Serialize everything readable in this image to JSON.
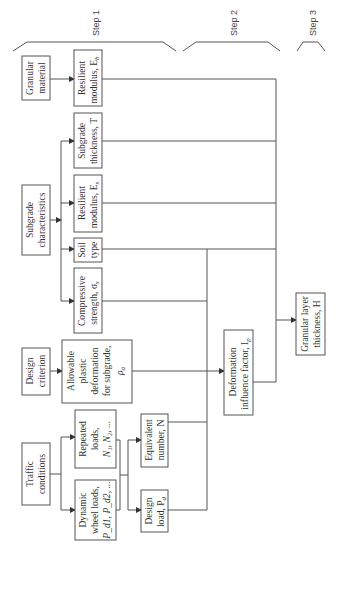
{
  "steps": [
    {
      "label": "Step 1"
    },
    {
      "label": "Step 2"
    },
    {
      "label": "Step 3"
    }
  ],
  "boxes": {
    "granular_material": {
      "lines": [
        "Granular",
        "material"
      ]
    },
    "resilient_modulus_base": {
      "lines": [
        "Resilient",
        "modulus, E"
      ],
      "sub": "b"
    },
    "subgrade_characteristics": {
      "lines": [
        "Subgrade",
        "characteristics"
      ]
    },
    "subgrade_thickness": {
      "lines": [
        "Subgrade",
        "thickness, T"
      ]
    },
    "resilient_modulus_subgrade": {
      "lines": [
        "Resilient",
        "modulus, E"
      ],
      "sub": "s"
    },
    "soil_type": {
      "lines": [
        "Soil",
        "type"
      ]
    },
    "compressive_strength": {
      "lines": [
        "Compressive",
        "strength, σ"
      ],
      "sub": "s"
    },
    "design_criterion": {
      "lines": [
        "Design",
        "criterion"
      ]
    },
    "allowable_plastic_deformation": {
      "lines": [
        "Allowable",
        "plastic",
        "deformation",
        "for subgrade,",
        "ρ"
      ],
      "sub": "a"
    },
    "traffic_conditions": {
      "lines": [
        "Traffic",
        "conditions"
      ]
    },
    "repeated_loads": {
      "lines": [
        "Repeated",
        "loads,",
        "N₁, N₂, ..."
      ]
    },
    "dynamic_wheel_loads": {
      "lines": [
        "Dynamic",
        "wheel loads,",
        "P_d1, P_d2, ..."
      ]
    },
    "equivalent_number": {
      "lines": [
        "Equivalent",
        "number, N"
      ]
    },
    "design_load": {
      "lines": [
        "Design",
        "load, P"
      ],
      "sub": "d"
    },
    "deformation_influence_factor": {
      "lines": [
        "Deformation",
        "influence factor, I"
      ],
      "sub": "p"
    },
    "granular_layer_thickness": {
      "lines": [
        "Granular layer",
        "thickness, H"
      ]
    }
  },
  "colors": {
    "stroke": "#555555",
    "text": "#333333",
    "background": "#ffffff"
  }
}
